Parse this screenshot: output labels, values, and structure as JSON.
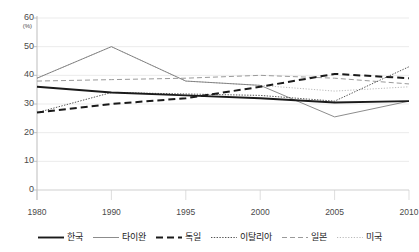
{
  "title_remnant": "",
  "axes": {
    "y_unit": "(%)",
    "y_ticks": [
      60,
      50,
      40,
      30,
      20,
      10,
      0
    ],
    "x_ticks": [
      "1980",
      "1990",
      "1995",
      "2000",
      "2005",
      "2010"
    ]
  },
  "legend": {
    "position": "bottom",
    "items": [
      {
        "label": "한국",
        "style": "solid-thick",
        "color": "#1a1a1a"
      },
      {
        "label": "타이완",
        "style": "solid-thin",
        "color": "#6e6e6e"
      },
      {
        "label": "독일",
        "style": "dashed-thick",
        "color": "#1a1a1a"
      },
      {
        "label": "이탈리아",
        "style": "dotted",
        "color": "#555555"
      },
      {
        "label": "일본",
        "style": "dashed-thin",
        "color": "#9a9a9a"
      },
      {
        "label": "미국",
        "style": "dotted-light",
        "color": "#a8a8a8"
      }
    ]
  },
  "chart_data": {
    "type": "line",
    "title": "",
    "xlabel": "",
    "ylabel": "(%)",
    "ylim": [
      0,
      60
    ],
    "ytick_step": 10,
    "grid": true,
    "legend_position": "bottom",
    "categories": [
      "1980",
      "1990",
      "1995",
      "2000",
      "2005",
      "2010"
    ],
    "series": [
      {
        "name": "한국",
        "values": [
          36,
          34,
          33,
          32,
          30.5,
          31
        ]
      },
      {
        "name": "타이완",
        "values": [
          39,
          50,
          38,
          36.5,
          25.5,
          31
        ]
      },
      {
        "name": "독일",
        "values": [
          27,
          30,
          32,
          36,
          40.5,
          39
        ]
      },
      {
        "name": "이탈리아",
        "values": [
          27,
          34,
          33.5,
          33,
          31,
          43
        ]
      },
      {
        "name": "일본",
        "values": [
          38,
          38.5,
          39,
          40,
          39,
          37
        ]
      },
      {
        "name": "미국",
        "values": [
          39,
          50,
          38,
          36.5,
          34.5,
          36
        ]
      }
    ]
  }
}
